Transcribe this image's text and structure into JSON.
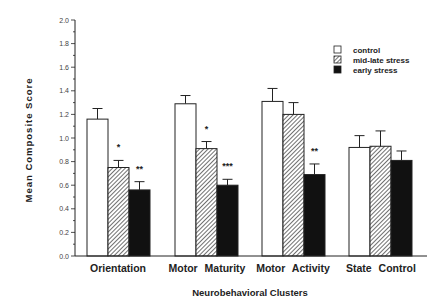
{
  "chart_data": {
    "type": "bar",
    "title": "",
    "xlabel": "Neurobehavioral Clusters",
    "ylabel": "Mean Composite Score",
    "ylim": [
      0,
      2.0
    ],
    "yticks": [
      "0.0",
      "0.2",
      "0.4",
      "0.6",
      "0.8",
      "1.0",
      "1.2",
      "1.4",
      "1.6",
      "1.8",
      "2.0"
    ],
    "grid": false,
    "legend_position": "upper right",
    "categories": [
      "Orientation",
      "Motor Maturity",
      "Motor Activity",
      "State Control"
    ],
    "series": [
      {
        "name": "control",
        "fill": "white",
        "values": [
          1.16,
          1.29,
          1.31,
          0.92
        ],
        "error_upper": [
          1.25,
          1.36,
          1.42,
          1.02
        ]
      },
      {
        "name": "mid-late stress",
        "fill": "hatched",
        "values": [
          0.75,
          0.91,
          1.2,
          0.93
        ],
        "error_upper": [
          0.81,
          0.97,
          1.3,
          1.06
        ]
      },
      {
        "name": "early stress",
        "fill": "black",
        "values": [
          0.56,
          0.6,
          0.69,
          0.81
        ],
        "error_upper": [
          0.63,
          0.65,
          0.78,
          0.89
        ]
      }
    ],
    "annotations": [
      {
        "category": "Orientation",
        "series": "mid-late stress",
        "text": "*"
      },
      {
        "category": "Orientation",
        "series": "early stress",
        "text": "**"
      },
      {
        "category": "Motor Maturity",
        "series": "mid-late stress",
        "text": "*"
      },
      {
        "category": "Motor Maturity",
        "series": "early stress",
        "text": "***"
      },
      {
        "category": "Motor Activity",
        "series": "early stress",
        "text": "**"
      }
    ]
  }
}
